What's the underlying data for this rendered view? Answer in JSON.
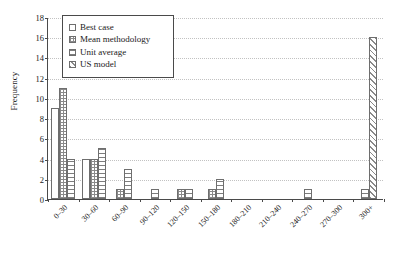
{
  "chart_data": {
    "type": "bar",
    "title": "",
    "xlabel": "",
    "ylabel": "Frequency",
    "ylim": [
      0,
      18
    ],
    "yticks": [
      0,
      2,
      4,
      6,
      8,
      10,
      12,
      14,
      16,
      18
    ],
    "grid": true,
    "legend_position": "top-left",
    "categories": [
      "0–30",
      "30–60",
      "60–90",
      "90–120",
      "120–150",
      "150–180",
      "180–210",
      "210–240",
      "240–270",
      "270–300",
      "300+"
    ],
    "series": [
      {
        "name": "Best case",
        "pattern": "plain",
        "values": [
          9,
          4,
          0,
          0,
          0,
          0,
          0,
          0,
          0,
          0,
          0
        ]
      },
      {
        "name": "Mean methodology",
        "pattern": "crosshatch",
        "values": [
          11,
          4,
          1,
          0,
          1,
          1,
          0,
          0,
          0,
          0,
          0
        ]
      },
      {
        "name": "Unit average",
        "pattern": "horizontal",
        "values": [
          4,
          5,
          3,
          1,
          1,
          2,
          0,
          0,
          1,
          0,
          1
        ]
      },
      {
        "name": "US model",
        "pattern": "diagonal",
        "values": [
          0,
          0,
          0,
          0,
          0,
          0,
          0,
          0,
          0,
          0,
          16
        ]
      }
    ]
  },
  "legend": {
    "items": [
      {
        "label": "Best case"
      },
      {
        "label": "Mean methodology"
      },
      {
        "label": "Unit average"
      },
      {
        "label": "US model"
      }
    ]
  },
  "axes": {
    "y_axis_title": "Frequency"
  }
}
